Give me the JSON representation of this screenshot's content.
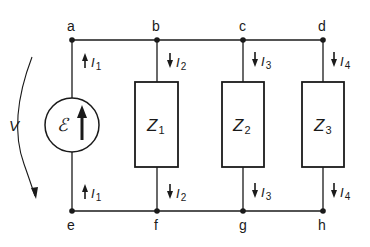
{
  "diagram": {
    "type": "parallel-circuit",
    "colors": {
      "line": "#1a1a1a",
      "background": "#ffffff"
    },
    "nodes": {
      "top": [
        "a",
        "b",
        "c",
        "d"
      ],
      "bottom": [
        "e",
        "f",
        "g",
        "h"
      ]
    },
    "source": {
      "symbol": "ℰ",
      "arrow": "up",
      "voltage_label": "V",
      "current_top": {
        "letter": "I",
        "sub": "1",
        "arrow": "up"
      },
      "current_bottom": {
        "letter": "I",
        "sub": "1",
        "arrow": "up"
      }
    },
    "branches": [
      {
        "impedance": {
          "letter": "Z",
          "sub": "1"
        },
        "current_top": {
          "letter": "I",
          "sub": "2",
          "arrow": "down"
        },
        "current_bottom": {
          "letter": "I",
          "sub": "2",
          "arrow": "down"
        }
      },
      {
        "impedance": {
          "letter": "Z",
          "sub": "2"
        },
        "current_top": {
          "letter": "I",
          "sub": "3",
          "arrow": "down"
        },
        "current_bottom": {
          "letter": "I",
          "sub": "3",
          "arrow": "down"
        }
      },
      {
        "impedance": {
          "letter": "Z",
          "sub": "3"
        },
        "current_top": {
          "letter": "I",
          "sub": "4",
          "arrow": "down"
        },
        "current_bottom": {
          "letter": "I",
          "sub": "4",
          "arrow": "down"
        }
      }
    ]
  }
}
